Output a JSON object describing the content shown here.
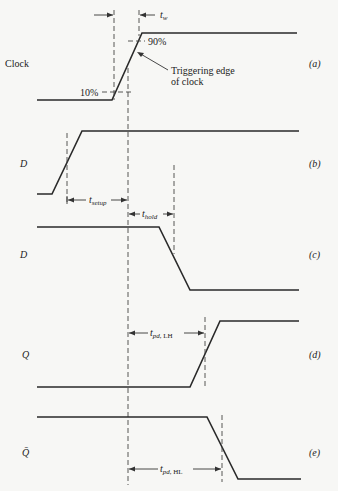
{
  "diagram": {
    "signals": [
      {
        "id": "a",
        "name": "Clock",
        "tag": "(a)"
      },
      {
        "id": "b",
        "name": "D",
        "tag": "(b)"
      },
      {
        "id": "c",
        "name": "D",
        "tag": "(c)"
      },
      {
        "id": "d",
        "name": "Q",
        "tag": "(d)"
      },
      {
        "id": "e",
        "name": "Q̄",
        "tag": "(e)"
      }
    ],
    "annotations": {
      "pct_low": "10%",
      "pct_high": "90%",
      "trigger_line1": "Triggering edge",
      "trigger_line2": "of clock",
      "tw_main": "t",
      "tw_sub": "w",
      "setup_main": "t",
      "setup_sub": "setup",
      "hold_main": "t",
      "hold_sub": "hold",
      "pdlh_main": "t",
      "pdlh_sub": "pd",
      "pdlh_suffix": ", LH",
      "pdhl_main": "t",
      "pdhl_sub": "pd",
      "pdhl_suffix": ", HL"
    }
  }
}
